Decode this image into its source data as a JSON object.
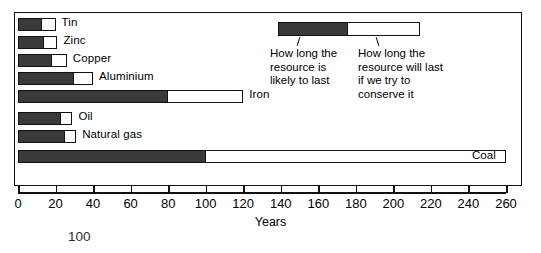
{
  "chart_data": {
    "type": "bar",
    "orientation": "horizontal",
    "title": "",
    "xlabel": "Years",
    "ylabel": "",
    "xlim": [
      0,
      260
    ],
    "xticks": [
      0,
      20,
      40,
      60,
      80,
      100,
      120,
      140,
      160,
      180,
      200,
      220,
      240,
      260
    ],
    "grid": false,
    "legend_position": "top-right",
    "categories": [
      "Tin",
      "Zinc",
      "Copper",
      "Aluminium",
      "Iron",
      "Oil",
      "Natural gas",
      "Coal"
    ],
    "series": [
      {
        "name": "How long the resource is likely to last",
        "color": "#3a3a3a",
        "values": [
          13,
          14,
          18,
          30,
          80,
          23,
          25,
          100
        ]
      },
      {
        "name": "How long the resource will last if we try to conserve it",
        "color": "#ffffff",
        "values": [
          20,
          21,
          26,
          40,
          120,
          29,
          31,
          260
        ]
      }
    ],
    "bars": [
      {
        "label": "Tin",
        "dark": 13,
        "light": 20,
        "label_position": "outside"
      },
      {
        "label": "Zinc",
        "dark": 14,
        "light": 21,
        "label_position": "outside"
      },
      {
        "label": "Copper",
        "dark": 18,
        "light": 26,
        "label_position": "outside"
      },
      {
        "label": "Aluminium",
        "dark": 30,
        "light": 40,
        "label_position": "outside"
      },
      {
        "label": "Iron",
        "dark": 80,
        "light": 120,
        "label_position": "outside"
      },
      {
        "label": "Oil",
        "dark": 23,
        "light": 29,
        "label_position": "outside"
      },
      {
        "label": "Natural gas",
        "dark": 25,
        "light": 31,
        "label_position": "outside"
      },
      {
        "label": "Coal",
        "dark": 100,
        "light": 260,
        "label_position": "inside-right"
      }
    ],
    "annotations": [
      {
        "name": "stray-number",
        "text": "100"
      }
    ]
  },
  "legend": {
    "left_label": "How long the\nresource is\nlikely to last",
    "right_label": "How long the\nresource will last\nif we try to\nconserve it",
    "dark_color": "#3a3a3a",
    "light_color": "#ffffff"
  },
  "axis": {
    "title": "Years",
    "tick_labels": [
      "0",
      "20",
      "40",
      "60",
      "80",
      "100",
      "120",
      "140",
      "160",
      "180",
      "200",
      "220",
      "240",
      "260"
    ]
  },
  "bar_labels": {
    "tin": "Tin",
    "zinc": "Zinc",
    "copper": "Copper",
    "aluminium": "Aluminium",
    "iron": "Iron",
    "oil": "Oil",
    "natural_gas": "Natural gas",
    "coal": "Coal"
  },
  "stray": {
    "number": "100"
  }
}
